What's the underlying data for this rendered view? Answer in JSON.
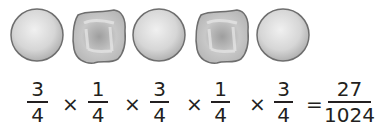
{
  "figure": {
    "peas": [
      {
        "phenotype": "round"
      },
      {
        "phenotype": "wrinkled"
      },
      {
        "phenotype": "round"
      },
      {
        "phenotype": "wrinkled"
      },
      {
        "phenotype": "round"
      }
    ],
    "colors": {
      "pea_fill_light": "#e6e6e6",
      "pea_fill_dark": "#a9a9a9",
      "pea_outline": "#6e6e6e",
      "text": "#231f20"
    }
  },
  "equation": {
    "terms": [
      {
        "numerator": "3",
        "denominator": "4"
      },
      {
        "numerator": "1",
        "denominator": "4"
      },
      {
        "numerator": "3",
        "denominator": "4"
      },
      {
        "numerator": "1",
        "denominator": "4"
      },
      {
        "numerator": "3",
        "denominator": "4"
      }
    ],
    "operator": "×",
    "equals": "=",
    "result": {
      "numerator": "27",
      "denominator": "1024"
    }
  }
}
